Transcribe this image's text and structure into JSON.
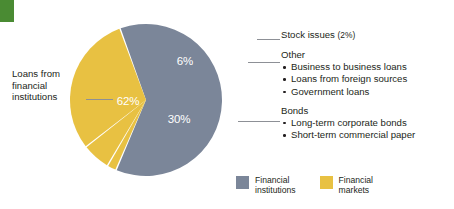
{
  "chart_data": {
    "type": "pie",
    "title": "",
    "categories": [
      "Loans from financial institutions",
      "Stock issues",
      "Other",
      "Bonds"
    ],
    "values": [
      62,
      2,
      6,
      30
    ],
    "value_labels": [
      "62%",
      "6%",
      "30%"
    ],
    "legend_position": "bottom-right",
    "grid": false,
    "series": [
      {
        "name": "Financial institutions",
        "color": "#7b8699",
        "slices": [
          {
            "label": "Loans from financial institutions",
            "value": 62,
            "display": "62%"
          }
        ]
      },
      {
        "name": "Financial markets",
        "color": "#e8c142",
        "slices": [
          {
            "label": "Stock issues",
            "value": 2,
            "display": ""
          },
          {
            "label": "Other",
            "value": 6,
            "display": "6%"
          },
          {
            "label": "Bonds",
            "value": 30,
            "display": "30%"
          }
        ]
      }
    ]
  },
  "colors": {
    "financial_institutions": "#7b8699",
    "financial_markets": "#e8c142",
    "accent_green": "#4a8b33",
    "leader_line": "#8d9096",
    "text": "#231f20"
  },
  "slice_labels": {
    "institutions": "62%",
    "other": "6%",
    "bonds": "30%"
  },
  "left_callout": {
    "line1": "Loans from",
    "line2": "financial",
    "line3": "institutions"
  },
  "callouts": {
    "stock": {
      "label": "Stock issues",
      "pct": "(2%)"
    },
    "other": {
      "label": "Other",
      "items": [
        "Business to business loans",
        "Loans from foreign sources",
        "Government loans"
      ]
    },
    "bonds": {
      "label": "Bonds",
      "items": [
        "Long-term corporate bonds",
        "Short-term commercial paper"
      ]
    }
  },
  "legend": {
    "items": [
      {
        "line1": "Financial",
        "line2": "institutions",
        "color": "#7b8699"
      },
      {
        "line1": "Financial",
        "line2": "markets",
        "color": "#e8c142"
      }
    ]
  }
}
